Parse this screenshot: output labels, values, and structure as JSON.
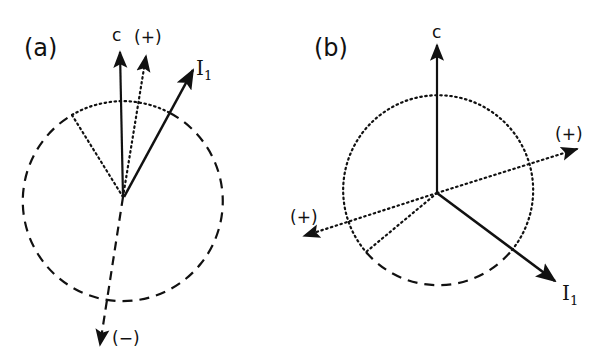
{
  "panels": [
    {
      "id": "a",
      "label": "(a)",
      "vectors": {
        "c": {
          "label": "c",
          "style": "solid"
        },
        "plus": {
          "label": "(+)",
          "style": "dotted"
        },
        "I1": {
          "label": "I",
          "subscript": "1",
          "style": "solid"
        },
        "minus": {
          "label": "(−)",
          "style": "dashed"
        }
      },
      "circle": {
        "upper_arc": "dotted",
        "remainder": "dashed"
      }
    },
    {
      "id": "b",
      "label": "(b)",
      "vectors": {
        "c": {
          "label": "c",
          "style": "solid"
        },
        "plus_right": {
          "label": "(+)",
          "style": "dotted"
        },
        "plus_left": {
          "label": "(+)",
          "style": "dotted"
        },
        "I1": {
          "label": "I",
          "subscript": "1",
          "style": "solid"
        }
      },
      "circle": {
        "lower_arc": "dashed",
        "remainder": "dotted"
      }
    }
  ],
  "colors": {
    "ink": "#111111",
    "background": "#ffffff"
  }
}
